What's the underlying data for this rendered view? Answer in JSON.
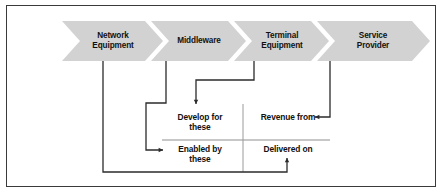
{
  "figure": {
    "border_color": "#3a3a3a",
    "background": "#ffffff",
    "chevron_fill": "#d2d2d2",
    "connector_color": "#2b2b2b",
    "divider_color": "#8f8f8f"
  },
  "chevrons": [
    {
      "id": "network-equipment",
      "label": "Network\nEquipment"
    },
    {
      "id": "middleware",
      "label": "Middleware"
    },
    {
      "id": "terminal-equipment",
      "label": "Terminal\nEquipment"
    },
    {
      "id": "service-provider",
      "label": "Service\nProvider"
    }
  ],
  "quadrants": [
    {
      "id": "develop-for-these",
      "label": "Develop for\nthese"
    },
    {
      "id": "revenue-from",
      "label": "Revenue from"
    },
    {
      "id": "enabled-by-these",
      "label": "Enabled by\nthese"
    },
    {
      "id": "delivered-on",
      "label": "Delivered on"
    }
  ],
  "connections": [
    {
      "id": "terminal-equipment-to-develop-for-these",
      "from": "Terminal Equipment",
      "to": "Develop for these"
    },
    {
      "id": "service-provider-to-revenue-from",
      "from": "Service Provider",
      "to": "Revenue from"
    },
    {
      "id": "middleware-to-enabled-by-these",
      "from": "Middleware",
      "to": "Enabled by these"
    },
    {
      "id": "network-equipment-to-delivered-on",
      "from": "Network Equipment",
      "to": "Delivered on"
    }
  ]
}
